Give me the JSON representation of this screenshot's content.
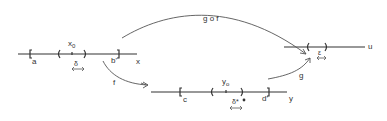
{
  "diagram": {
    "colors": {
      "line": "#333333",
      "arrow": "#555555",
      "background": "#ffffff"
    },
    "lines": {
      "x": {
        "label": "x",
        "left_bracket_label": "a",
        "right_bracket_label": "b'",
        "point_label": "x",
        "point_subscript": "0",
        "radius_label": "δ"
      },
      "y": {
        "label": "y",
        "left_bracket_label": "c",
        "right_bracket_label": "d'",
        "point_label": "y",
        "point_subscript": "o",
        "radius_label": "δ*"
      },
      "u": {
        "label": "u",
        "radius_label": "ε"
      }
    },
    "arrows": {
      "gof": {
        "label": "g o f"
      },
      "f": {
        "label": "f"
      },
      "g": {
        "label": "g"
      }
    }
  }
}
